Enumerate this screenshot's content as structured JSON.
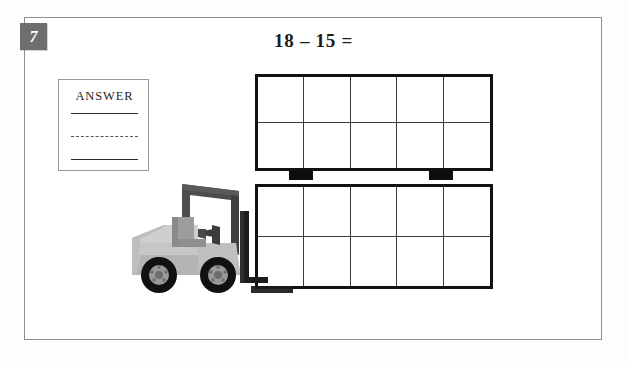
{
  "worksheet": {
    "question_number": "7",
    "equation": "18 – 15 =",
    "answer_box": {
      "label": "ANSWER"
    }
  },
  "illustration": {
    "forklift_label": "forklift-illustration",
    "crate_top": {
      "name": "crate-top",
      "columns": 5,
      "rows": 2,
      "cell_count": 10
    },
    "crate_bottom": {
      "name": "crate-bottom",
      "columns": 5,
      "rows": 2,
      "cell_count": 10
    },
    "total_cells": 20
  },
  "colors": {
    "badge_background": "#6e6e6e",
    "badge_text": "#ffffff",
    "page_border": "#8e8e8e",
    "crate_border": "#111111",
    "crate_gridline": "#3a3a3a",
    "forklift_body": "#b9b9b9",
    "forklift_frame": "#4a4a4a",
    "tire": "#111111",
    "answer_rule": "#2b2b2b"
  }
}
